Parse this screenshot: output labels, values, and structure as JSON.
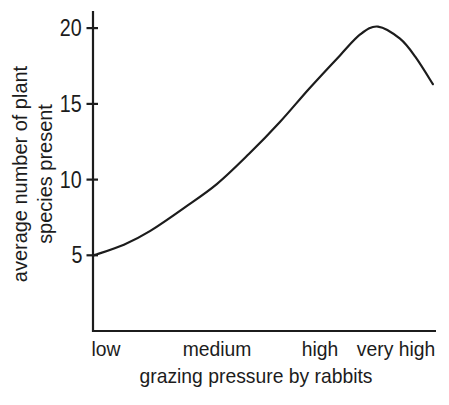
{
  "figure": {
    "background": "#ffffff",
    "ink_color": "#1c1c1c"
  },
  "chart_data": {
    "type": "line",
    "title": "",
    "xlabel": "grazing pressure by rabbits",
    "ylabel": "average number of plant species present",
    "ylabel_lines": [
      "average number of plant",
      "species present"
    ],
    "x_categories": [
      "low",
      "medium",
      "high",
      "very high"
    ],
    "x_category_pos": [
      0.038,
      0.362,
      0.662,
      0.883
    ],
    "y_ticks": [
      5,
      10,
      15,
      20
    ],
    "ylim": [
      0,
      21
    ],
    "grid": "off",
    "legend": "none",
    "series": [
      {
        "name": "average number of plant species present",
        "points_xfrac_yvalue": [
          [
            0.003,
            5.0
          ],
          [
            0.09,
            5.7
          ],
          [
            0.166,
            6.6
          ],
          [
            0.27,
            8.2
          ],
          [
            0.361,
            9.7
          ],
          [
            0.455,
            11.7
          ],
          [
            0.545,
            13.8
          ],
          [
            0.63,
            16.0
          ],
          [
            0.72,
            18.2
          ],
          [
            0.78,
            19.6
          ],
          [
            0.831,
            20.1
          ],
          [
            0.895,
            19.3
          ],
          [
            0.94,
            18.1
          ],
          [
            0.991,
            16.3
          ]
        ],
        "peak_value": 20,
        "start_value": 5,
        "end_value": 16
      }
    ]
  }
}
